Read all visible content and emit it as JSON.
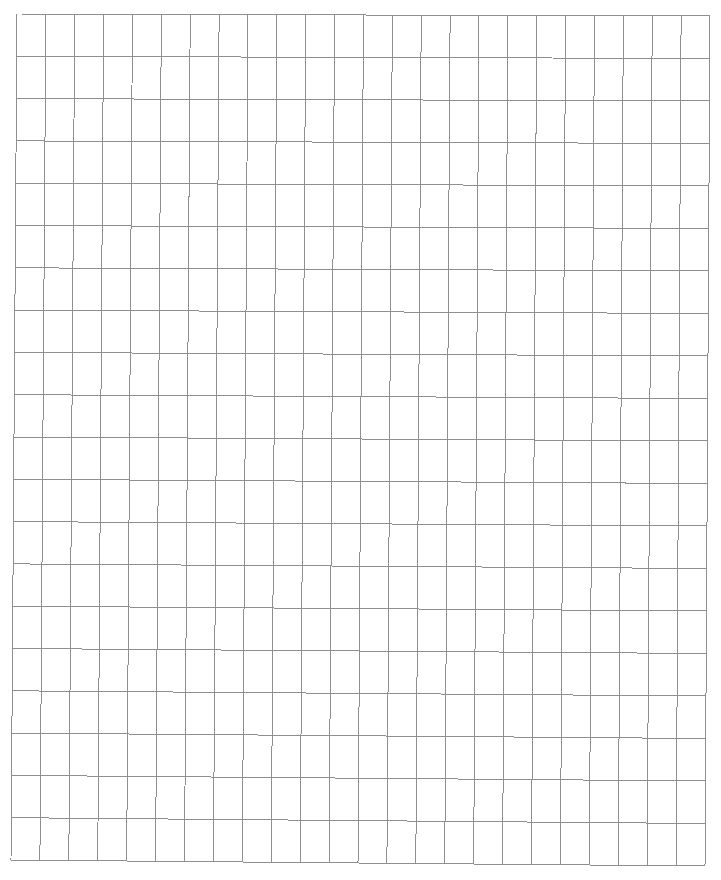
{
  "document": {
    "title": "",
    "type": "blank grid worksheet"
  },
  "grid": {
    "columns": 24,
    "rows": 20,
    "line_color": "#8f8f8f",
    "background": "#ffffff",
    "corners": {
      "top_left": [
        17,
        14
      ],
      "top_right": [
        710,
        16
      ],
      "bottom_left": [
        11,
        860
      ],
      "bottom_right": [
        705,
        866
      ]
    }
  }
}
